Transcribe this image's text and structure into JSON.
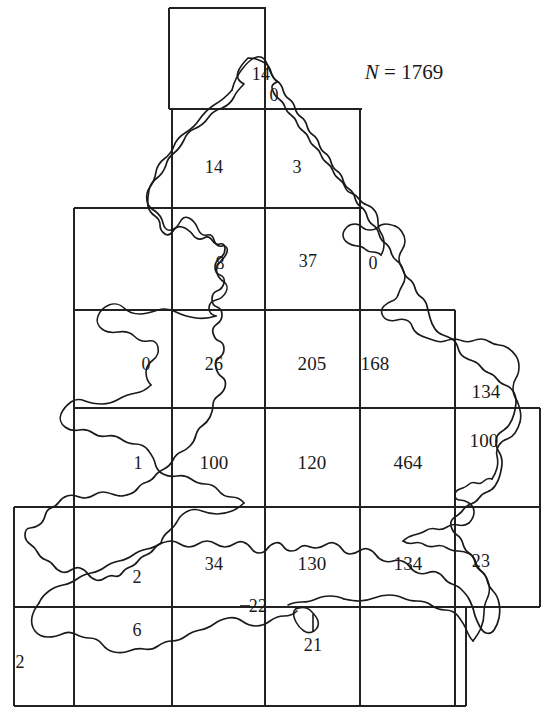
{
  "figure": {
    "type": "choropleth-count-grid-map",
    "region_name": "England and Wales",
    "total_label_prefix": "N",
    "total_label_eq": "=",
    "total_value": "1769",
    "grid": {
      "columns_x": [
        14,
        74,
        172,
        265,
        360,
        455,
        466,
        540
      ],
      "rows_y": [
        8,
        109,
        208,
        310,
        408,
        507,
        607,
        706
      ]
    }
  },
  "chart_data": {
    "type": "map",
    "title": "N = 1769",
    "xlabel": "",
    "ylabel": "",
    "grid": true,
    "legend": "none",
    "annotations": [
      "N = 1769"
    ],
    "categories": [
      "r1c3",
      "r1c3b",
      "r2c3",
      "r2c4",
      "r3c3",
      "r3c4",
      "r3c5",
      "r4c2",
      "r4c3",
      "r4c4",
      "r4c5",
      "r4c6",
      "r5c2",
      "r5c3",
      "r5c4",
      "r5c5",
      "r5c6",
      "r6c2",
      "r6c3",
      "r6c4",
      "r6c5",
      "r6c6",
      "r7c1",
      "r7c2",
      "r7c4",
      "r7c4b"
    ],
    "values": [
      14,
      0,
      14,
      3,
      8,
      37,
      0,
      0,
      26,
      205,
      168,
      134,
      1,
      100,
      120,
      464,
      100,
      2,
      34,
      130,
      134,
      23,
      2,
      6,
      22,
      21
    ],
    "cells": [
      {
        "name": "northumberland-coast",
        "value": "14",
        "x": 261,
        "y": 74
      },
      {
        "name": "northumberland-east",
        "value": "0",
        "x": 274,
        "y": 95
      },
      {
        "name": "cumbria-durham",
        "value": "14",
        "x": 214,
        "y": 167
      },
      {
        "name": "north-yorkshire",
        "value": "3",
        "x": 297,
        "y": 167
      },
      {
        "name": "lancashire",
        "value": "8",
        "x": 220,
        "y": 263
      },
      {
        "name": "yorkshire",
        "value": "37",
        "x": 308,
        "y": 261
      },
      {
        "name": "humberside",
        "value": "0",
        "x": 373,
        "y": 263
      },
      {
        "name": "north-wales-coast",
        "value": "0",
        "x": 146,
        "y": 364
      },
      {
        "name": "cheshire",
        "value": "26",
        "x": 214,
        "y": 364
      },
      {
        "name": "midlands-north",
        "value": "205",
        "x": 312,
        "y": 364
      },
      {
        "name": "lincolnshire",
        "value": "168",
        "x": 375,
        "y": 364
      },
      {
        "name": "east-anglia-north",
        "value": "134",
        "x": 486,
        "y": 392
      },
      {
        "name": "wales-mid",
        "value": "1",
        "x": 138,
        "y": 463
      },
      {
        "name": "welsh-border",
        "value": "100",
        "x": 214,
        "y": 463
      },
      {
        "name": "midlands-south",
        "value": "120",
        "x": 312,
        "y": 463
      },
      {
        "name": "london-home-counties",
        "value": "464",
        "x": 408,
        "y": 463
      },
      {
        "name": "east-anglia-south",
        "value": "100",
        "x": 484,
        "y": 441
      },
      {
        "name": "south-wales",
        "value": "2",
        "x": 137,
        "y": 577
      },
      {
        "name": "somerset-avon",
        "value": "34",
        "x": 214,
        "y": 564
      },
      {
        "name": "wessex",
        "value": "130",
        "x": 312,
        "y": 564
      },
      {
        "name": "sussex-kent-inland",
        "value": "134",
        "x": 408,
        "y": 564
      },
      {
        "name": "kent",
        "value": "23",
        "x": 481,
        "y": 561
      },
      {
        "name": "cornwall",
        "value": "2",
        "x": 20,
        "y": 662
      },
      {
        "name": "devon",
        "value": "6",
        "x": 137,
        "y": 630
      },
      {
        "name": "dorset-coast",
        "value": "22",
        "x": 258,
        "y": 606
      },
      {
        "name": "isle-of-wight",
        "value": "21",
        "x": 313,
        "y": 645
      }
    ]
  },
  "colors": {
    "ink": "#1a1a1a",
    "grid": "#222222",
    "background": "#ffffff"
  }
}
